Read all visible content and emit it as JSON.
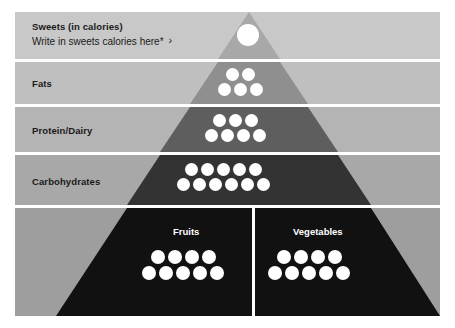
{
  "figure": {
    "name": "food-pyramid",
    "background": "#ffffff"
  },
  "colors": {
    "band_sweets": "#c8c8c8",
    "band_fats": "#bfbfbf",
    "band_protein": "#b4b4b4",
    "band_carbs": "#a8a8a8",
    "band_base": "#9e9e9e",
    "tri_sweets": "#a8a8a8",
    "tri_fats": "#8f8f8f",
    "tri_protein": "#5e5e5e",
    "tri_carbs": "#333333",
    "tri_base": "#111111",
    "dot": "#ffffff",
    "text_dark": "#1a1a1a",
    "text_light": "#ffffff",
    "gap": "#ffffff"
  },
  "layers": [
    {
      "id": "sweets",
      "label": "Sweets (in calories)",
      "sublabel": "Write in sweets calories here*",
      "chevron": "›",
      "dot_rows": [
        1
      ],
      "dot_total": 1
    },
    {
      "id": "fats",
      "label": "Fats",
      "dot_rows": [
        2,
        3
      ],
      "dot_total": 5
    },
    {
      "id": "protein-dairy",
      "label": "Protein/Dairy",
      "dot_rows": [
        3,
        4
      ],
      "dot_total": 7
    },
    {
      "id": "carbohydrates",
      "label": "Carbohydrates",
      "dot_rows": [
        5,
        6
      ],
      "dot_total": 11
    }
  ],
  "base": {
    "cells": [
      {
        "id": "fruits",
        "title": "Fruits",
        "dot_rows": [
          4,
          5
        ],
        "dot_total": 9
      },
      {
        "id": "vegetables",
        "title": "Vegetables",
        "dot_rows": [
          4,
          5
        ],
        "dot_total": 9
      }
    ]
  }
}
